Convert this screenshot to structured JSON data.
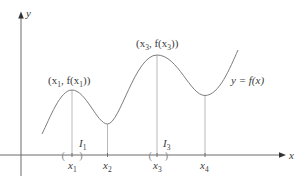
{
  "figure": {
    "axes": {
      "x_label": "x",
      "y_label": "y"
    },
    "curve_label": "y = f(x)",
    "points": [
      {
        "id": "x1",
        "label_main": "x",
        "label_sub": "1",
        "kind": "local-max",
        "point_label": {
          "open": "(x",
          "sub": "1",
          "mid": ", f(x",
          "sub2": "1",
          "close": "))"
        }
      },
      {
        "id": "x2",
        "label_main": "x",
        "label_sub": "2",
        "kind": "local-min"
      },
      {
        "id": "x3",
        "label_main": "x",
        "label_sub": "3",
        "kind": "local-max",
        "point_label": {
          "open": "(x",
          "sub": "3",
          "mid": ", f(x",
          "sub2": "3",
          "close": "))"
        }
      },
      {
        "id": "x4",
        "label_main": "x",
        "label_sub": "4",
        "kind": "local-min"
      }
    ],
    "intervals": [
      {
        "id": "I1",
        "label_main": "I",
        "label_sub": "1",
        "around": "x1",
        "open_bracket": "(",
        "close_bracket": ")"
      },
      {
        "id": "I3",
        "label_main": "I",
        "label_sub": "3",
        "around": "x3",
        "open_bracket": "(",
        "close_bracket": ")"
      }
    ],
    "colors": {
      "axis": "#6b6b6b",
      "curve": "#7d7d7d",
      "guide": "#b9b9b9",
      "text": "#3a3a3a"
    }
  }
}
